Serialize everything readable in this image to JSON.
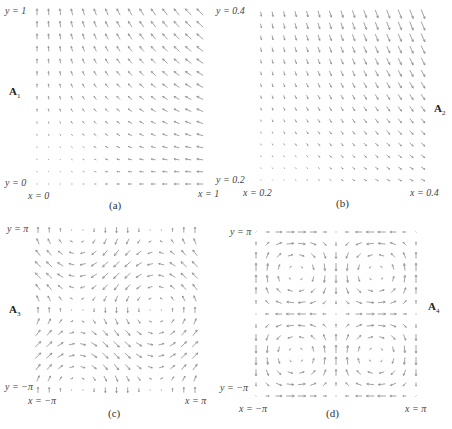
{
  "figure": {
    "panels": [
      {
        "id": "a",
        "caption": "(a)",
        "field_name": "A",
        "field_sub": "1",
        "y_top_label": "y = 1",
        "y_bottom_label": "y = 0",
        "x_left_label": "x = 0",
        "x_right_label": "x = 1",
        "field": "(-x, y)",
        "domain": {
          "x": [
            0,
            1
          ],
          "y": [
            0,
            1
          ]
        },
        "grid": {
          "cols": 15,
          "rows": 15
        }
      },
      {
        "id": "b",
        "caption": "(b)",
        "field_name": "A",
        "field_sub": "2",
        "y_top_label": "y = 0.4",
        "y_bottom_label": "y = 0.2",
        "x_left_label": "x = 0.2",
        "x_right_label": "x = 0.4",
        "field": "(x, -2.5y)",
        "domain": {
          "x": [
            0.2,
            0.4
          ],
          "y": [
            0.2,
            0.4
          ]
        },
        "grid": {
          "cols": 15,
          "rows": 15
        }
      },
      {
        "id": "c",
        "caption": "(c)",
        "field_name": "A",
        "field_sub": "3",
        "y_top_label": "y = π",
        "y_bottom_label": "y = −π",
        "x_left_label": "x = −π",
        "x_right_label": "x = π",
        "field": "(-sin y, -cos x)",
        "domain": {
          "x": [
            -3.14159,
            3.14159
          ],
          "y": [
            -3.14159,
            3.14159
          ]
        },
        "grid": {
          "cols": 15,
          "rows": 15
        }
      },
      {
        "id": "d",
        "caption": "(d)",
        "field_name": "A",
        "field_sub": "4",
        "y_top_label": "y = π",
        "y_bottom_label": "y = −π",
        "x_left_label": "x = −π",
        "x_right_label": "x = π",
        "field": "(sin x cos y, -cos x sin y)",
        "domain": {
          "x": [
            -3.14159,
            3.14159
          ],
          "y": [
            -3.14159,
            3.14159
          ]
        },
        "grid": {
          "cols": 15,
          "rows": 15
        }
      }
    ],
    "arrow_color": "#8a8a8a"
  }
}
